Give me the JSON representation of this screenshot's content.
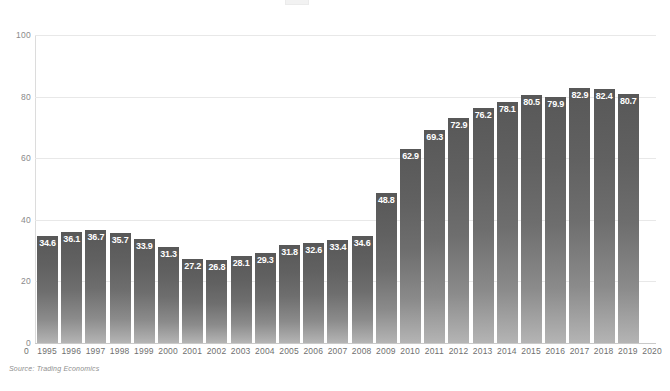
{
  "chart_data": {
    "type": "bar",
    "title": "",
    "subtitle": "",
    "xlabel": "",
    "ylabel": "",
    "ylim": [
      0,
      100
    ],
    "yticks": [
      "0",
      "20",
      "40",
      "60",
      "80",
      "100"
    ],
    "grid": true,
    "legend": null,
    "categories": [
      "1995",
      "1996",
      "1997",
      "1998",
      "1999",
      "2000",
      "2001",
      "2002",
      "2003",
      "2004",
      "2005",
      "2006",
      "2007",
      "2008",
      "2009",
      "2010",
      "2011",
      "2012",
      "2013",
      "2014",
      "2015",
      "2016",
      "2017",
      "2018",
      "2019"
    ],
    "values": [
      34.6,
      36.1,
      36.7,
      35.7,
      33.9,
      31.3,
      27.2,
      26.8,
      28.1,
      29.3,
      31.8,
      32.6,
      33.4,
      34.6,
      48.8,
      62.9,
      69.3,
      72.9,
      76.2,
      78.1,
      80.5,
      79.9,
      82.9,
      82.4,
      80.7
    ],
    "value_labels": [
      "34.6",
      "36.1",
      "36.7",
      "35.7",
      "33.9",
      "31.3",
      "27.2",
      "26.8",
      "28.1",
      "29.3",
      "31.8",
      "32.6",
      "33.4",
      "34.6",
      "48.8",
      "62.9",
      "69.3",
      "72.9",
      "76.2",
      "78.1",
      "80.5",
      "79.9",
      "82.9",
      "82.4",
      "80.7"
    ],
    "xtick_labels": [
      "1995",
      "1996",
      "1997",
      "1998",
      "1999",
      "2000",
      "2001",
      "2002",
      "2003",
      "2004",
      "2005",
      "2006",
      "2007",
      "2008",
      "2009",
      "2010",
      "2011",
      "2012",
      "2013",
      "2014",
      "2015",
      "2016",
      "2017",
      "2018",
      "2019",
      "2020"
    ],
    "axis_origin_label": "0",
    "bar_color_top": "#585858",
    "bar_color_bottom": "#b4b4b4",
    "value_label_color": "#ffffff",
    "gridline_color": "#e8e8e8",
    "axis_label_color": "#6f6f6f"
  },
  "source": {
    "text": "Source: Trading Economics"
  }
}
